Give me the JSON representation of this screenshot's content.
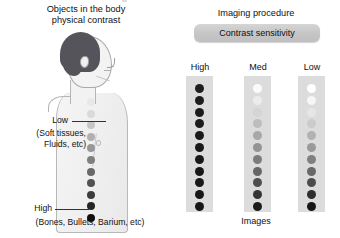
{
  "figure": {
    "left_panel": {
      "title_line1": "Objects in the body",
      "title_line2": "physical contrast",
      "low_label": "Low",
      "low_sub_line1": "(Soft tissues,",
      "low_sub_line2": "Fluids, etc)",
      "high_label": "High",
      "high_sub": "(Bones, Bullets, Barium, etc)"
    },
    "right_panel": {
      "title": "Imaging procedure",
      "pill_label": "Contrast sensitivity",
      "columns": [
        "High",
        "Med",
        "Low"
      ],
      "footer_label": "Images"
    }
  },
  "chart_data": {
    "type": "heatmap",
    "xlabel": "Imaging procedure contrast sensitivity",
    "ylabel": "Object physical contrast (Low → High)",
    "grid": false,
    "legend": null,
    "annotations": [
      "Objects in the body physical contrast",
      "Low (Soft tissues, Fluids, etc)",
      "High (Bones, Bullets, Barium, etc)",
      "Imaging procedure",
      "Contrast sensitivity",
      "Images"
    ],
    "rows": 11,
    "row_index": [
      1,
      2,
      3,
      4,
      5,
      6,
      7,
      8,
      9,
      10,
      11
    ],
    "series": [
      {
        "name": "Object physical contrast",
        "note": "Dot column drawn on the body; gray level 0=white,1=black",
        "values": [
          0.1,
          0.16,
          0.24,
          0.33,
          0.43,
          0.53,
          0.63,
          0.72,
          0.81,
          0.9,
          1.0
        ],
        "colors": [
          "#e8e8e8",
          "#dadada",
          "#c6c6c6",
          "#b0b0b0",
          "#989898",
          "#808080",
          "#686868",
          "#525252",
          "#3c3c3c",
          "#262626",
          "#101010"
        ]
      },
      {
        "name": "High",
        "note": "High contrast sensitivity image: all objects rendered near-black (saturated)",
        "values": [
          0.92,
          0.93,
          0.94,
          0.94,
          0.95,
          0.95,
          0.95,
          0.96,
          0.96,
          0.96,
          0.96
        ],
        "colors": [
          "#1e1e1e",
          "#1c1c1c",
          "#1b1b1b",
          "#1a1a1a",
          "#191919",
          "#181818",
          "#181818",
          "#171717",
          "#171717",
          "#161616",
          "#161616"
        ]
      },
      {
        "name": "Med",
        "note": "Medium contrast sensitivity image: low-contrast objects lost in background",
        "values": [
          0.02,
          0.1,
          0.22,
          0.34,
          0.44,
          0.54,
          0.64,
          0.73,
          0.82,
          0.9,
          0.96
        ],
        "colors": [
          "#fbfbfb",
          "#ececec",
          "#d4d4d4",
          "#bdbdbd",
          "#a8a8a8",
          "#949494",
          "#7c7c7c",
          "#666666",
          "#4e4e4e",
          "#343434",
          "#1c1c1c"
        ]
      },
      {
        "name": "Low",
        "note": "Low contrast sensitivity image: widest rendered gray range, top objects invisible",
        "values": [
          0.0,
          0.04,
          0.12,
          0.26,
          0.4,
          0.52,
          0.63,
          0.73,
          0.82,
          0.91,
          0.97
        ],
        "colors": [
          "#ffffff",
          "#f6f6f6",
          "#e6e6e6",
          "#cbcbcb",
          "#b2b2b2",
          "#9a9a9a",
          "#808080",
          "#686868",
          "#4c4c4c",
          "#2e2e2e",
          "#161616"
        ]
      }
    ]
  }
}
